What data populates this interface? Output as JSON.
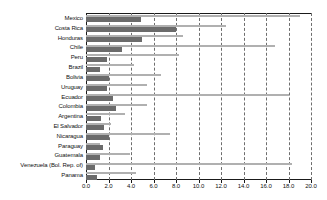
{
  "chart_data": {
    "type": "bar",
    "orientation": "horizontal",
    "title": "",
    "xlabel": "",
    "ylabel": "",
    "xlim": [
      0.0,
      20.0
    ],
    "xticks": [
      "0.0",
      "2.0",
      "4.0",
      "6.0",
      "8.0",
      "10.0",
      "12.0",
      "14.0",
      "16.0",
      "18.0",
      "20.0"
    ],
    "xtick_values": [
      0.0,
      2.0,
      4.0,
      6.0,
      8.0,
      10.0,
      12.0,
      14.0,
      16.0,
      18.0,
      20.0
    ],
    "grid": "vertical-dashed",
    "legend": "none",
    "categories": [
      "Mexico",
      "Costa Rica",
      "Honduras",
      "Chile",
      "Peru",
      "Brazil",
      "Bolivia",
      "Uruguay",
      "Ecuador",
      "Colombia",
      "Argentina",
      "El Salvador",
      "Nicaragua",
      "Paraguay",
      "Guatemala",
      "Venezuela (Bol. Rep. of)",
      "Panama"
    ],
    "series": [
      {
        "name": "series-1",
        "color": "#b0b0b0",
        "values": [
          19.0,
          12.4,
          8.6,
          16.8,
          8.3,
          4.3,
          6.7,
          5.4,
          18.0,
          5.4,
          3.5,
          2.2,
          7.5,
          1.2,
          3.9,
          18.3,
          4.4
        ]
      },
      {
        "name": "series-2",
        "color": "#6b6b6b",
        "values": [
          4.9,
          8.0,
          5.0,
          3.2,
          1.9,
          1.2,
          2.0,
          1.9,
          2.4,
          2.7,
          1.3,
          1.6,
          2.0,
          1.5,
          1.2,
          0.8,
          1.0
        ]
      }
    ]
  }
}
